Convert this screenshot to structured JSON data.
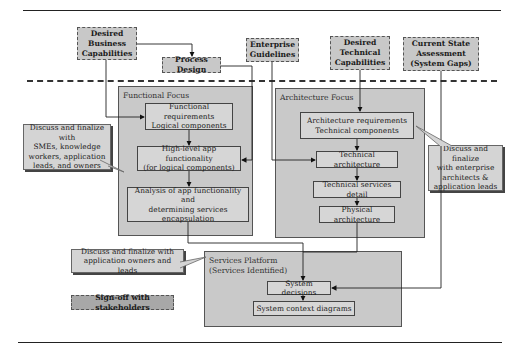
{
  "diagram": {
    "inputs": {
      "desired_business_capabilities": "Desired\nBusiness\nCapabilities",
      "process_design": "Process Design",
      "enterprise_guidelines": "Enterprise\nGuidelines",
      "desired_technical_capabilities": "Desired\nTechnical\nCapabilities",
      "current_state_assessment": "Current State\nAssessment\n(System Gaps)"
    },
    "functional_focus": {
      "title": "Functional Focus",
      "nodes": [
        "Functional requirements\nLogical components",
        "High-level app functionality\n(for logical components)",
        "Analysis of app functionality and\ndetermining services\nencapsulation"
      ]
    },
    "architecture_focus": {
      "title": "Architecture Focus",
      "nodes": [
        "Architecture requirements\nTechnical components",
        "Technical architecture",
        "Technical services detail",
        "Physical architecture"
      ]
    },
    "services_platform": {
      "title": "Services Platform\n(Services Identified)",
      "nodes": [
        "System decisions",
        "System context diagrams"
      ]
    },
    "callouts": {
      "smes": "Discuss and finalize with\nSMEs, knowledge\nworkers, application\nleads, and owners",
      "enterprise_architects": "Discuss and finalize\nwith enterprise\narchitects &\napplication leads",
      "app_owners": "Discuss and finalize with\napplication owners and leads"
    },
    "signoff": "Sign-off with stakeholders"
  }
}
